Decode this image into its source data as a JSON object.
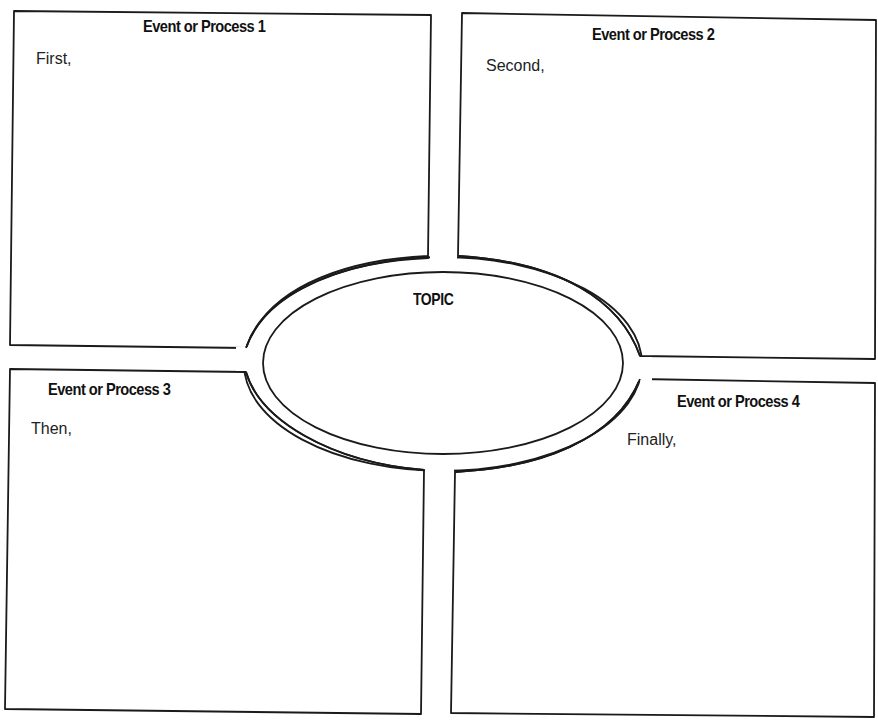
{
  "diagram": {
    "type": "four-box sequence graphic organizer around central topic",
    "stroke_color": "#1a1a1a",
    "background": "#ffffff",
    "topic": {
      "label": "TOPIC"
    },
    "boxes": [
      {
        "position": "top-left",
        "title": "Event or Process 1",
        "prompt": "First,"
      },
      {
        "position": "top-right",
        "title": "Event or Process 2",
        "prompt": "Second,"
      },
      {
        "position": "bottom-left",
        "title": "Event or Process 3",
        "prompt": "Then,"
      },
      {
        "position": "bottom-right",
        "title": "Event or Process 4",
        "prompt": "Finally,"
      }
    ]
  }
}
